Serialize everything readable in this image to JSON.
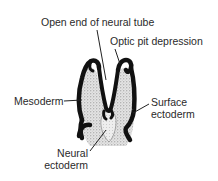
{
  "diagram": {
    "colors": {
      "ectoderm": "#111111",
      "mesoderm_fill": "#d9d9d9",
      "neural_ectoderm_fill": "#e6e6e6",
      "label_text": "#2a2a2a",
      "leader_line": "#222222"
    },
    "labels": {
      "open_end": "Open end of neural tube",
      "optic_pit": "Optic pit depression",
      "mesoderm": "Mesoderm",
      "surface_ectoderm_line1": "Surface",
      "surface_ectoderm_line2": "ectoderm",
      "neural_ectoderm_line1": "Neural",
      "neural_ectoderm_line2": "ectoderm"
    }
  }
}
